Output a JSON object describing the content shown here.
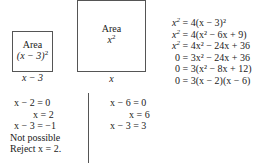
{
  "diagram": {
    "small_square": {
      "label_line1": "Area",
      "label_line2_pre": "(x − 3)",
      "label_line2_exp": "2",
      "side_label": "x − 3"
    },
    "large_square": {
      "label_line1": "Area",
      "label_line2_base": "x",
      "label_line2_exp": "2",
      "side_label": "x"
    }
  },
  "derivation": [
    {
      "lhs": "x",
      "lhs_exp": "2",
      "rhs": "= 4(x − 3)²"
    },
    {
      "lhs": "x",
      "lhs_exp": "2",
      "rhs": "= 4(x² − 6x + 9)"
    },
    {
      "lhs": "x",
      "lhs_exp": "2",
      "rhs": "= 4x² − 24x + 36"
    },
    {
      "lhs": "0",
      "lhs_exp": "",
      "rhs": "= 3x² − 24x + 36"
    },
    {
      "lhs": "0",
      "lhs_exp": "",
      "rhs": "= 3(x² − 8x + 12)"
    },
    {
      "lhs": "0",
      "lhs_exp": "",
      "rhs": "= 3(x − 2)(x − 6)"
    }
  ],
  "case_left": {
    "lines": [
      "x − 2 = 0",
      "x = 2",
      "x − 3 = −1",
      "Not possible",
      "Reject x = 2."
    ]
  },
  "case_right": {
    "lines": [
      "x − 6 = 0",
      "x = 6",
      "x − 3 = 3"
    ]
  }
}
